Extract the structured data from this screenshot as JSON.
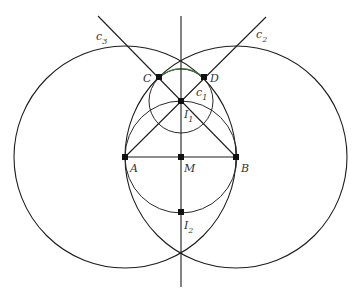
{
  "diagram": {
    "type": "geometric-construction",
    "colors": {
      "line": "#1e1e1e",
      "accent_arc": "#3a7a3a",
      "point": "#111111",
      "background": "#ffffff"
    },
    "points": [
      {
        "id": "A",
        "label": "A",
        "x": 125,
        "y": 157
      },
      {
        "id": "M",
        "label": "M",
        "x": 181,
        "y": 157
      },
      {
        "id": "B",
        "label": "B",
        "x": 236,
        "y": 157
      },
      {
        "id": "C",
        "label": "C",
        "x": 159,
        "y": 77
      },
      {
        "id": "D",
        "label": "D",
        "x": 204,
        "y": 77
      },
      {
        "id": "I1",
        "label": "I",
        "sub": "1",
        "x": 181,
        "y": 101
      },
      {
        "id": "I2",
        "label": "I",
        "sub": "2",
        "x": 181,
        "y": 212
      }
    ],
    "circles": [
      {
        "id": "big-left",
        "cx": 125,
        "cy": 157,
        "r": 111
      },
      {
        "id": "big-right",
        "cx": 236,
        "cy": 157,
        "r": 111
      },
      {
        "id": "thales",
        "cx": 181,
        "cy": 157,
        "r": 56
      },
      {
        "id": "c1",
        "cx": 181,
        "cy": 101,
        "r": 32
      }
    ],
    "lines": [
      {
        "id": "perpendicular-bisector",
        "x1": 181,
        "y1": 16,
        "x2": 181,
        "y2": 287
      },
      {
        "id": "c3",
        "x1": 98,
        "y1": 16,
        "x2": 236,
        "y2": 157
      },
      {
        "id": "c2",
        "x1": 266,
        "y1": 17,
        "x2": 125,
        "y2": 157
      },
      {
        "id": "AB",
        "x1": 125,
        "y1": 157,
        "x2": 236,
        "y2": 157
      }
    ],
    "labels": {
      "c3": {
        "text": "c",
        "sub": "3"
      },
      "c2": {
        "text": "c",
        "sub": "2"
      },
      "c1": {
        "text": "c",
        "sub": "1"
      },
      "A": "A",
      "B": "B",
      "M": "M",
      "C": "C",
      "D": "D",
      "I1": {
        "text": "I",
        "sub": "1"
      },
      "I2": {
        "text": "I",
        "sub": "2"
      }
    }
  }
}
